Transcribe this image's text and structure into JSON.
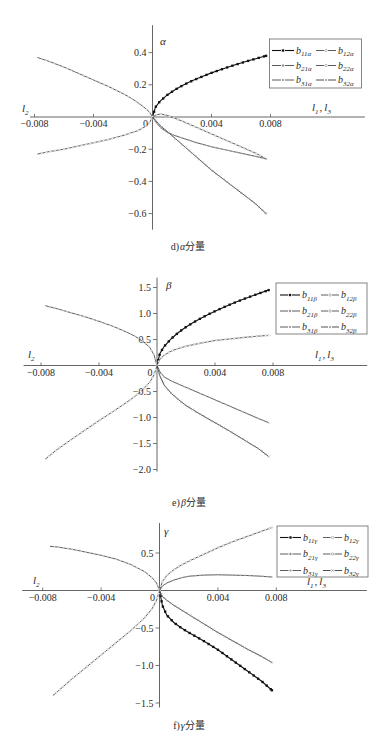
{
  "figure": {
    "panels": [
      {
        "caption": {
          "prefix": "d)",
          "symbol": "α",
          "suffix": "分量"
        },
        "y_axis_label": "α",
        "x_left_label": {
          "base": "l",
          "sub": "2"
        },
        "x_right_label": {
          "a_base": "l",
          "a_sub": "1",
          "sep": ",",
          "b_base": "l",
          "b_sub": "3"
        },
        "legend": [
          {
            "base": "b",
            "sub": "11α"
          },
          {
            "base": "b",
            "sub": "12α"
          },
          {
            "base": "b",
            "sub": "21α"
          },
          {
            "base": "b",
            "sub": "22α"
          },
          {
            "base": "b",
            "sub": "31α"
          },
          {
            "base": "b",
            "sub": "32α"
          }
        ]
      },
      {
        "caption": {
          "prefix": "e)",
          "symbol": "β",
          "suffix": "分量"
        },
        "y_axis_label": "β",
        "x_left_label": {
          "base": "l",
          "sub": "2"
        },
        "x_right_label": {
          "a_base": "l",
          "a_sub": "1",
          "sep": ",",
          "b_base": "l",
          "b_sub": "3"
        },
        "legend": [
          {
            "base": "b",
            "sub": "11β"
          },
          {
            "base": "b",
            "sub": "12β"
          },
          {
            "base": "b",
            "sub": "21β"
          },
          {
            "base": "b",
            "sub": "22β"
          },
          {
            "base": "b",
            "sub": "31β"
          },
          {
            "base": "b",
            "sub": "32β"
          }
        ]
      },
      {
        "caption": {
          "prefix": "f)",
          "symbol": "γ",
          "suffix": "分量"
        },
        "y_axis_label": "γ",
        "x_left_label": {
          "base": "l",
          "sub": "2"
        },
        "x_right_label": {
          "a_base": "l",
          "a_sub": "1",
          "sep": ",",
          "b_base": "l",
          "b_sub": "3"
        },
        "legend": [
          {
            "base": "b",
            "sub": "11γ"
          },
          {
            "base": "b",
            "sub": "12γ"
          },
          {
            "base": "b",
            "sub": "21γ"
          },
          {
            "base": "b",
            "sub": "22γ"
          },
          {
            "base": "b",
            "sub": "31γ"
          },
          {
            "base": "b",
            "sub": "32γ"
          }
        ]
      }
    ]
  },
  "chart_data": [
    {
      "type": "line",
      "title": "d) α分量",
      "xlabel": "l1, l3 (right) / l2 (left)",
      "ylabel": "α",
      "xlim": [
        -0.0083,
        0.0144
      ],
      "ylim": [
        -0.7,
        0.57
      ],
      "grid": false,
      "legend_position": "upper right",
      "xticks": [
        -0.008,
        -0.004,
        0,
        0.004,
        0.008
      ],
      "xtick_labels": [
        "−0.008",
        "−0.004",
        "0",
        "0.004",
        "0.008"
      ],
      "yticks": [
        0.4,
        0.2,
        -0.2,
        -0.4,
        -0.6
      ],
      "ytick_labels": [
        "0.4",
        "0.2",
        "−0.2",
        "−0.4",
        "−0.6"
      ],
      "series": [
        {
          "name": "b11α",
          "line_color": "#111111",
          "marker": "square",
          "marker_color": "#111111",
          "x": [
            0,
            0.0002,
            0.0005,
            0.001,
            0.0015,
            0.002,
            0.0025,
            0.003,
            0.0035,
            0.004,
            0.0045,
            0.005,
            0.0055,
            0.006,
            0.0065,
            0.007,
            0.0077
          ],
          "y": [
            0,
            0.061,
            0.097,
            0.137,
            0.168,
            0.194,
            0.217,
            0.237,
            0.256,
            0.274,
            0.29,
            0.306,
            0.321,
            0.335,
            0.349,
            0.362,
            0.38
          ]
        },
        {
          "name": "b12α",
          "line_color": "#4a4a4a",
          "marker": "circle-open",
          "marker_color": "#bdbdbd",
          "x": [
            0,
            0.0003,
            0.0006,
            0.001,
            0.002,
            0.003,
            0.004,
            0.005,
            0.006,
            0.007,
            0.0077
          ],
          "y": [
            0,
            0.015,
            0.018,
            0.01,
            -0.025,
            -0.065,
            -0.105,
            -0.145,
            -0.185,
            -0.225,
            -0.26
          ]
        },
        {
          "name": "b21α",
          "line_color": "#4a4a4a",
          "marker": "diamond",
          "marker_color": "#cfcfcf",
          "x": [
            -0.0078,
            -0.007,
            -0.006,
            -0.005,
            -0.004,
            -0.003,
            -0.002,
            -0.0015,
            -0.001,
            -0.0005,
            -0.0002,
            0
          ],
          "y": [
            0.37,
            0.345,
            0.31,
            0.27,
            0.23,
            0.19,
            0.145,
            0.12,
            0.09,
            0.055,
            0.03,
            0
          ]
        },
        {
          "name": "b22α",
          "line_color": "#4a4a4a",
          "marker": "circle-open",
          "marker_color": "#c4c4c4",
          "x": [
            -0.0078,
            -0.007,
            -0.006,
            -0.005,
            -0.004,
            -0.003,
            -0.002,
            -0.0015,
            -0.001,
            -0.0005,
            -0.0002,
            0
          ],
          "y": [
            -0.23,
            -0.215,
            -0.2,
            -0.18,
            -0.16,
            -0.14,
            -0.115,
            -0.1,
            -0.085,
            -0.06,
            -0.035,
            0
          ]
        },
        {
          "name": "b31α",
          "line_color": "#4a4a4a",
          "marker": "dot",
          "marker_color": "#b0b0b0",
          "x": [
            0,
            0.0003,
            0.0006,
            0.001,
            0.0015,
            0.002,
            0.003,
            0.004,
            0.005,
            0.006,
            0.007,
            0.0077
          ],
          "y": [
            0,
            -0.04,
            -0.07,
            -0.095,
            -0.115,
            -0.13,
            -0.16,
            -0.185,
            -0.205,
            -0.225,
            -0.245,
            -0.26
          ]
        },
        {
          "name": "b32α",
          "line_color": "#3a3a3a",
          "marker": "cross",
          "marker_color": "#9a9a9a",
          "x": [
            0,
            0.0003,
            0.0006,
            0.001,
            0.002,
            0.003,
            0.004,
            0.005,
            0.006,
            0.007,
            0.0077
          ],
          "y": [
            0,
            -0.03,
            -0.06,
            -0.09,
            -0.17,
            -0.25,
            -0.33,
            -0.4,
            -0.47,
            -0.54,
            -0.6
          ]
        }
      ]
    },
    {
      "type": "line",
      "title": "e) β分量",
      "xlabel": "l1, l3 (right) / l2 (left)",
      "ylabel": "β",
      "xlim": [
        -0.0092,
        0.0145
      ],
      "ylim": [
        -2.04,
        1.69
      ],
      "grid": false,
      "legend_position": "upper right",
      "xticks": [
        -0.008,
        -0.004,
        0,
        0.004,
        0.008
      ],
      "xtick_labels": [
        "−0.008",
        "−0.004",
        "0",
        "0.004",
        "0.008"
      ],
      "yticks": [
        1.5,
        1.0,
        0.5,
        -0.5,
        -1.0,
        -1.5,
        -2.0
      ],
      "ytick_labels": [
        "1.5",
        "1.0",
        "0.5",
        "−0.5",
        "−1.0",
        "−1.5",
        "−2.0"
      ],
      "series": [
        {
          "name": "b11β",
          "line_color": "#111111",
          "marker": "square",
          "marker_color": "#111111",
          "x": [
            0,
            0.0002,
            0.0005,
            0.001,
            0.0015,
            0.002,
            0.0025,
            0.003,
            0.0035,
            0.004,
            0.0045,
            0.005,
            0.0055,
            0.006,
            0.0065,
            0.007,
            0.0077
          ],
          "y": [
            0,
            0.233,
            0.37,
            0.52,
            0.64,
            0.74,
            0.826,
            0.905,
            0.978,
            1.045,
            1.108,
            1.168,
            1.225,
            1.28,
            1.332,
            1.382,
            1.45
          ]
        },
        {
          "name": "b12β",
          "line_color": "#4a4a4a",
          "marker": "circle-open",
          "marker_color": "#bdbdbd",
          "x": [
            0,
            0.0002,
            0.0005,
            0.001,
            0.0015,
            0.002,
            0.003,
            0.004,
            0.005,
            0.006,
            0.007,
            0.0077
          ],
          "y": [
            0,
            0.12,
            0.2,
            0.28,
            0.33,
            0.37,
            0.43,
            0.48,
            0.51,
            0.54,
            0.565,
            0.58
          ]
        },
        {
          "name": "b21β",
          "line_color": "#4a4a4a",
          "marker": "diamond",
          "marker_color": "#cfcfcf",
          "x": [
            -0.0077,
            -0.007,
            -0.006,
            -0.005,
            -0.004,
            -0.003,
            -0.002,
            -0.0015,
            -0.001,
            -0.0005,
            -0.0002,
            0
          ],
          "y": [
            1.15,
            1.1,
            1.02,
            0.94,
            0.85,
            0.75,
            0.63,
            0.56,
            0.47,
            0.35,
            0.2,
            0
          ]
        },
        {
          "name": "b22β",
          "line_color": "#4a4a4a",
          "marker": "circle-open",
          "marker_color": "#c4c4c4",
          "x": [
            -0.0077,
            -0.007,
            -0.006,
            -0.005,
            -0.004,
            -0.003,
            -0.002,
            -0.0015,
            -0.001,
            -0.0005,
            -0.0002,
            0
          ],
          "y": [
            -1.8,
            -1.64,
            -1.44,
            -1.25,
            -1.06,
            -0.88,
            -0.69,
            -0.59,
            -0.47,
            -0.32,
            -0.18,
            0
          ]
        },
        {
          "name": "b31β",
          "line_color": "#4a4a4a",
          "marker": "dot",
          "marker_color": "#b0b0b0",
          "x": [
            0,
            0.0002,
            0.0005,
            0.001,
            0.0015,
            0.002,
            0.003,
            0.004,
            0.005,
            0.006,
            0.007,
            0.0077
          ],
          "y": [
            0,
            -0.12,
            -0.22,
            -0.3,
            -0.36,
            -0.42,
            -0.54,
            -0.66,
            -0.78,
            -0.9,
            -1.02,
            -1.1
          ]
        },
        {
          "name": "b32β",
          "line_color": "#3a3a3a",
          "marker": "cross",
          "marker_color": "#9a9a9a",
          "x": [
            0,
            0.0002,
            0.0005,
            0.001,
            0.0015,
            0.002,
            0.003,
            0.004,
            0.005,
            0.006,
            0.007,
            0.0077
          ],
          "y": [
            0,
            -0.2,
            -0.38,
            -0.54,
            -0.66,
            -0.77,
            -0.94,
            -1.1,
            -1.26,
            -1.43,
            -1.6,
            -1.75
          ]
        }
      ]
    },
    {
      "type": "line",
      "title": "f) γ分量",
      "xlabel": "l1, l3 (right) / l2 (left)",
      "ylabel": "γ",
      "xlim": [
        -0.0094,
        0.0142
      ],
      "ylim": [
        -1.56,
        0.9
      ],
      "grid": false,
      "legend_position": "upper right",
      "xticks": [
        -0.008,
        -0.004,
        0,
        0.004,
        0.008
      ],
      "xtick_labels": [
        "−0.008",
        "−0.004",
        "0",
        "0.004",
        "0.008"
      ],
      "yticks": [
        0.5,
        -0.5,
        -1.0,
        -1.5
      ],
      "ytick_labels": [
        "0.5",
        "−0.5",
        "−1.0",
        "−1.5"
      ],
      "series": [
        {
          "name": "b11γ",
          "line_color": "#111111",
          "marker": "square",
          "marker_color": "#111111",
          "x": [
            0,
            0.0002,
            0.0005,
            0.001,
            0.0015,
            0.002,
            0.003,
            0.004,
            0.005,
            0.006,
            0.007,
            0.0077
          ],
          "y": [
            0,
            -0.2,
            -0.33,
            -0.43,
            -0.5,
            -0.56,
            -0.67,
            -0.79,
            -0.93,
            -1.07,
            -1.21,
            -1.33
          ]
        },
        {
          "name": "b12γ",
          "line_color": "#4a4a4a",
          "marker": "circle-open",
          "marker_color": "#bdbdbd",
          "x": [
            0,
            0.0002,
            0.0005,
            0.001,
            0.0015,
            0.002,
            0.003,
            0.004,
            0.005,
            0.006,
            0.007,
            0.0077
          ],
          "y": [
            0,
            0.12,
            0.2,
            0.28,
            0.34,
            0.39,
            0.48,
            0.57,
            0.65,
            0.72,
            0.79,
            0.84
          ]
        },
        {
          "name": "b21γ",
          "line_color": "#4a4a4a",
          "marker": "diamond",
          "marker_color": "#cfcfcf",
          "x": [
            -0.0075,
            -0.007,
            -0.006,
            -0.005,
            -0.004,
            -0.003,
            -0.002,
            -0.0015,
            -0.001,
            -0.0005,
            -0.0002,
            0
          ],
          "y": [
            0.59,
            0.58,
            0.55,
            0.51,
            0.47,
            0.42,
            0.35,
            0.3,
            0.25,
            0.17,
            0.1,
            0
          ]
        },
        {
          "name": "b22γ",
          "line_color": "#4a4a4a",
          "marker": "circle-open",
          "marker_color": "#c4c4c4",
          "x": [
            -0.0073,
            -0.007,
            -0.006,
            -0.005,
            -0.004,
            -0.003,
            -0.002,
            -0.0015,
            -0.001,
            -0.0005,
            -0.0002,
            0
          ],
          "y": [
            -1.4,
            -1.35,
            -1.18,
            -1.02,
            -0.86,
            -0.7,
            -0.54,
            -0.45,
            -0.36,
            -0.24,
            -0.13,
            0
          ]
        },
        {
          "name": "b31γ",
          "line_color": "#4a4a4a",
          "marker": "dot",
          "marker_color": "#b0b0b0",
          "x": [
            0,
            0.0002,
            0.0005,
            0.001,
            0.0015,
            0.002,
            0.003,
            0.004,
            0.005,
            0.006,
            0.007,
            0.0077
          ],
          "y": [
            0,
            0.06,
            0.1,
            0.14,
            0.17,
            0.19,
            0.205,
            0.21,
            0.205,
            0.2,
            0.19,
            0.18
          ]
        },
        {
          "name": "b32γ",
          "line_color": "#3a3a3a",
          "marker": "cross",
          "marker_color": "#9a9a9a",
          "x": [
            0,
            0.0002,
            0.0005,
            0.001,
            0.0015,
            0.002,
            0.003,
            0.004,
            0.005,
            0.006,
            0.007,
            0.0077
          ],
          "y": [
            0,
            -0.08,
            -0.13,
            -0.2,
            -0.26,
            -0.32,
            -0.44,
            -0.56,
            -0.67,
            -0.78,
            -0.88,
            -0.96
          ]
        }
      ]
    }
  ]
}
